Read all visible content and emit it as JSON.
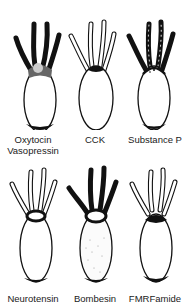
{
  "figure": {
    "panels": [
      {
        "id": "oxytocin",
        "label_line1": "Oxytocin",
        "label_line2": "Vasopressin",
        "tentacles": "dark",
        "head": "stippled",
        "base": "dark"
      },
      {
        "id": "cck",
        "label_line1": "CCK",
        "label_line2": "",
        "tentacles": "outline",
        "head": "dark",
        "base": "none"
      },
      {
        "id": "substance-p",
        "label_line1": "Substance P",
        "label_line2": "",
        "tentacles": "dark-dotted",
        "head": "dotted",
        "base": "dark"
      },
      {
        "id": "neurotensin",
        "label_line1": "Neurotensin",
        "label_line2": "",
        "tentacles": "outline",
        "head": "ring",
        "base": "dark"
      },
      {
        "id": "bombesin",
        "label_line1": "Bombesin",
        "label_line2": "",
        "tentacles": "dark",
        "head": "ring",
        "base": "dark",
        "body": "stippled"
      },
      {
        "id": "fmrfamide",
        "label_line1": "FMRFamide",
        "label_line2": "",
        "tentacles": "outline-dotted",
        "head": "dark",
        "base": "dark"
      }
    ]
  }
}
